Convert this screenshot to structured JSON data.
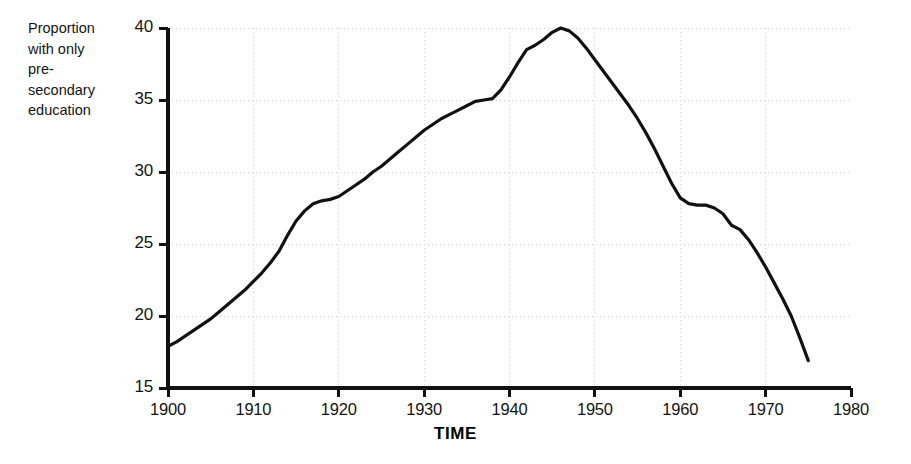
{
  "chart_data": {
    "type": "line",
    "title": "",
    "subtitle": "",
    "xlabel": "TIME",
    "ylabel": "Proportion\nwith only\npre-\nsecondary\neducation",
    "ylabel_lines": [
      "Proportion",
      "with only",
      "pre-",
      "secondary",
      "education"
    ],
    "xlim": [
      1900,
      1980
    ],
    "ylim": [
      15,
      40
    ],
    "xticks": [
      1900,
      1910,
      1920,
      1930,
      1940,
      1950,
      1960,
      1970,
      1980
    ],
    "yticks": [
      15,
      20,
      25,
      30,
      35,
      40
    ],
    "xtick_labels": [
      "1900",
      "1910",
      "1920",
      "1930",
      "1940",
      "1950",
      "1960",
      "1970",
      "1980"
    ],
    "ytick_labels": [
      "15",
      "20",
      "25",
      "30",
      "35",
      "40"
    ],
    "grid": "faint dotted gridlines at major ticks",
    "legend": "none",
    "line_color": "#111111",
    "line_width": 3.2,
    "series": [
      {
        "name": "Proportion with only pre-secondary education",
        "x": [
          1900,
          1901,
          1902,
          1903,
          1904,
          1905,
          1906,
          1907,
          1908,
          1909,
          1910,
          1911,
          1912,
          1913,
          1914,
          1915,
          1916,
          1917,
          1918,
          1919,
          1920,
          1921,
          1922,
          1923,
          1924,
          1925,
          1926,
          1927,
          1928,
          1929,
          1930,
          1931,
          1932,
          1933,
          1934,
          1935,
          1936,
          1937,
          1938,
          1939,
          1940,
          1941,
          1942,
          1943,
          1944,
          1945,
          1946,
          1947,
          1948,
          1949,
          1950,
          1951,
          1952,
          1953,
          1954,
          1955,
          1956,
          1957,
          1958,
          1959,
          1960,
          1961,
          1962,
          1963,
          1964,
          1965,
          1966,
          1967,
          1968,
          1969,
          1970,
          1971,
          1972,
          1973,
          1974,
          1975
        ],
        "y": [
          17.9,
          18.2,
          18.6,
          19.0,
          19.4,
          19.8,
          20.3,
          20.8,
          21.3,
          21.8,
          22.4,
          23.0,
          23.7,
          24.5,
          25.6,
          26.6,
          27.3,
          27.8,
          28.0,
          28.1,
          28.3,
          28.7,
          29.1,
          29.5,
          30.0,
          30.4,
          30.9,
          31.4,
          31.9,
          32.4,
          32.9,
          33.3,
          33.7,
          34.0,
          34.3,
          34.6,
          34.9,
          35.0,
          35.1,
          35.7,
          36.6,
          37.6,
          38.5,
          38.8,
          39.2,
          39.7,
          40.0,
          39.8,
          39.3,
          38.6,
          37.8,
          37.0,
          36.2,
          35.4,
          34.6,
          33.7,
          32.7,
          31.6,
          30.4,
          29.2,
          28.2,
          27.8,
          27.7,
          27.7,
          27.5,
          27.1,
          26.3,
          26.0,
          25.3,
          24.4,
          23.4,
          22.3,
          21.2,
          20.0,
          18.5,
          16.9
        ],
        "annotations": [
          {
            "label": "start",
            "x": 1900,
            "y": 17.9
          },
          {
            "label": "first plateau",
            "x": 1918,
            "y": 28.0
          },
          {
            "label": "second plateau",
            "x": 1935,
            "y": 34.9
          },
          {
            "label": "peak",
            "x": 1946,
            "y": 40.0
          },
          {
            "label": "third plateau",
            "x": 1962,
            "y": 27.7
          },
          {
            "label": "end",
            "x": 1975,
            "y": 16.9
          }
        ]
      }
    ]
  },
  "axes": {
    "y_title_text": "Proportion with only pre-secondary education",
    "x_title_text": "TIME"
  }
}
